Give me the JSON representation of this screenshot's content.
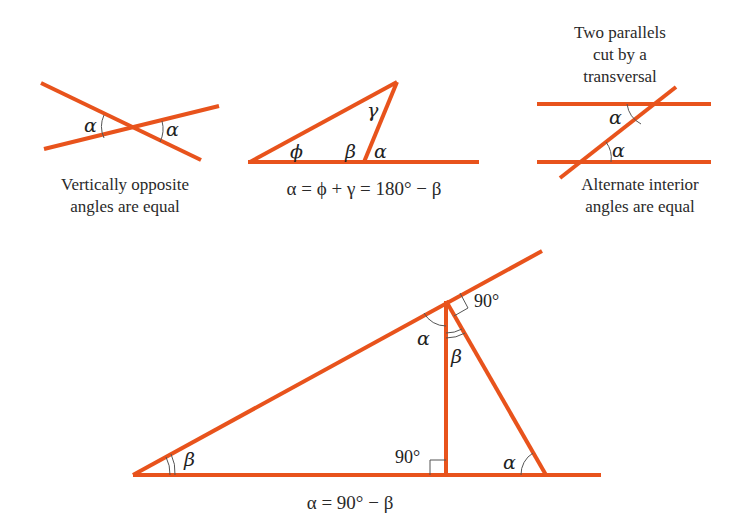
{
  "colors": {
    "line": "#e8531c",
    "text": "#222222",
    "arc": "#555555"
  },
  "diagrams": {
    "vertical": {
      "angle_left": "α",
      "angle_right": "α",
      "caption_line1": "Vertically opposite",
      "caption_line2": "angles are equal"
    },
    "exterior": {
      "angle_phi": "ϕ",
      "angle_gamma": "γ",
      "angle_beta": "β",
      "angle_alpha": "α",
      "equation": "α = ϕ + γ = 180° − β"
    },
    "parallels": {
      "title_line1": "Two parallels",
      "title_line2": "cut by a",
      "title_line3": "transversal",
      "angle_top": "α",
      "angle_bottom": "α",
      "caption_line1": "Alternate interior",
      "caption_line2": "angles are equal"
    },
    "right_triangle": {
      "angle_left": "β",
      "angle_top_alpha": "α",
      "angle_top_beta": "β",
      "angle_top_right": "90°",
      "angle_foot_right": "90°",
      "angle_bottom_alpha": "α",
      "equation": "α = 90° − β"
    }
  }
}
